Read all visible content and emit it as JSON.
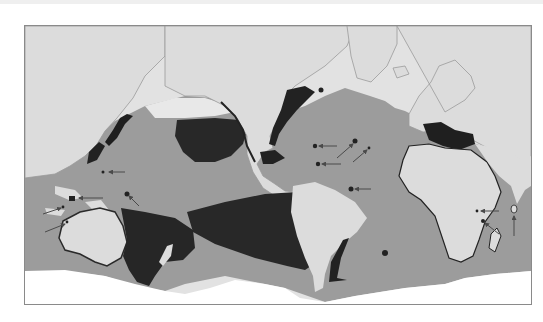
{
  "map": {
    "type": "world-map",
    "projection": "pacific-centered",
    "colors": {
      "land": "#dcdcdc",
      "land_outline": "#9a9a9a",
      "arctic_land": "#e6e6e6",
      "ocean_zone": "#9c9c9c",
      "dense_zone": "#2a2a2a",
      "polar_white": "#ffffff",
      "frame_border": "#8a8a8a",
      "arrow": "#4a4a4a"
    },
    "regions": [
      {
        "name": "north-pacific-gyre-patch"
      },
      {
        "name": "south-pacific-patch"
      },
      {
        "name": "tasman-sea-patch"
      },
      {
        "name": "mediterranean-patch"
      },
      {
        "name": "caribbean-gulf-coast-patch"
      },
      {
        "name": "patagonia-coast-patch"
      }
    ],
    "arrows_count": 14
  }
}
